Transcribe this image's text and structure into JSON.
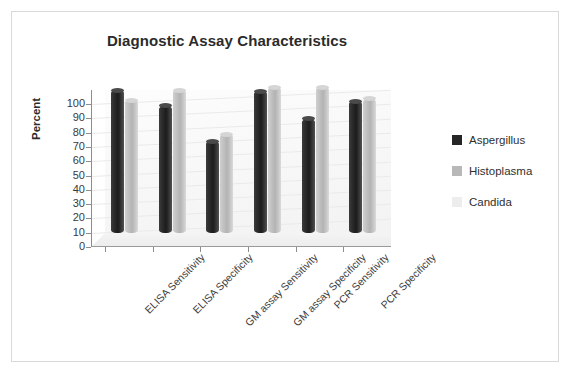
{
  "chart_data": {
    "type": "bar",
    "title": "Diagnostic Assay Characteristics",
    "xlabel": "",
    "ylabel": "Percent",
    "ylim": [
      0,
      100
    ],
    "yticks": [
      0,
      10,
      20,
      30,
      40,
      50,
      60,
      70,
      80,
      90,
      100
    ],
    "grid": true,
    "legend_position": "right",
    "style": "3d-cylinder",
    "categories": [
      "ELISA Sensitivity",
      "ELISA Specificity",
      "GM assay Sensitivity",
      "GM assay Specificity",
      "PCR Sensitivity",
      "PCR Specificity"
    ],
    "series": [
      {
        "name": "Aspergillus",
        "color": "#262626",
        "values": [
          100,
          89,
          64,
          99,
          80,
          92
        ]
      },
      {
        "name": "Histoplasma",
        "color": "#b8b8b8",
        "values": [
          93,
          100,
          69,
          102,
          102,
          94
        ]
      },
      {
        "name": "Candida",
        "color": "#ededed",
        "values": [
          0,
          0,
          0,
          0,
          0,
          0
        ]
      }
    ]
  },
  "colors": {
    "frame_border": "#d9d9d9",
    "axis": "#8d8d8d",
    "gridline": "#eaeaea",
    "text": "#2b2b2b",
    "background": "#ffffff"
  }
}
